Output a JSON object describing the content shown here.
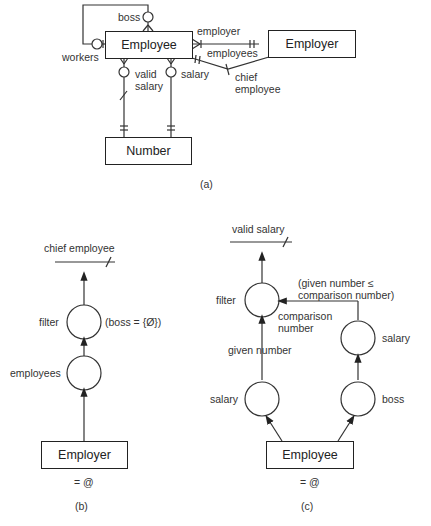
{
  "panel_a": {
    "entities": {
      "employee": "Employee",
      "employer": "Employer",
      "number": "Number"
    },
    "relations": {
      "boss": "boss",
      "workers": "workers",
      "employer": "employer",
      "employees": "employees",
      "valid_salary_1": "valid",
      "valid_salary_2": "salary",
      "salary": "salary",
      "chief_employee_1": "chief",
      "chief_employee_2": "employee"
    },
    "caption": "(a)"
  },
  "panel_b": {
    "output": "chief employee",
    "filter": "filter",
    "condition": "(boss = {Ø})",
    "employees": "employees",
    "entity": "Employer",
    "eq": "= @",
    "caption": "(b)"
  },
  "panel_c": {
    "output": "valid salary",
    "filter": "filter",
    "condition_1": "(given number ≤",
    "condition_2": "comparison number)",
    "comparison_1": "comparison",
    "comparison_2": "number",
    "given_number": "given number",
    "salary_right": "salary",
    "salary_left": "salary",
    "boss": "boss",
    "entity": "Employee",
    "eq": "= @",
    "caption": "(c)"
  }
}
